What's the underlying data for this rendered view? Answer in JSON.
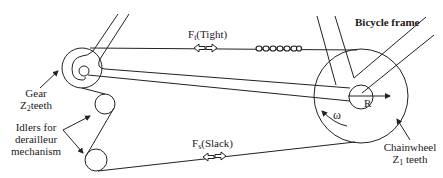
{
  "diagram": {
    "labels": {
      "frame": "Bicycle frame",
      "tight_force_symbol": "F",
      "tight_force_sub": "t",
      "tight_force_desc": "(Tight)",
      "slack_force_symbol": "F",
      "slack_force_sub": "s",
      "slack_force_desc": "(Slack)",
      "gear_line1": "Gear",
      "gear_line2_symbol": "Z",
      "gear_line2_sub": "2",
      "gear_line2_rest": "teeth",
      "idlers_line1": "Idlers for",
      "idlers_line2": "derailleur",
      "idlers_line3": "mechanism",
      "chainwheel_line1": "Chainwheel",
      "chainwheel_line2_symbol": "Z",
      "chainwheel_line2_sub": "1",
      "chainwheel_line2_rest": "teeth",
      "radius": "R",
      "omega": "ω"
    },
    "colors": {
      "stroke": "#222222",
      "background": "#ffffff"
    }
  }
}
